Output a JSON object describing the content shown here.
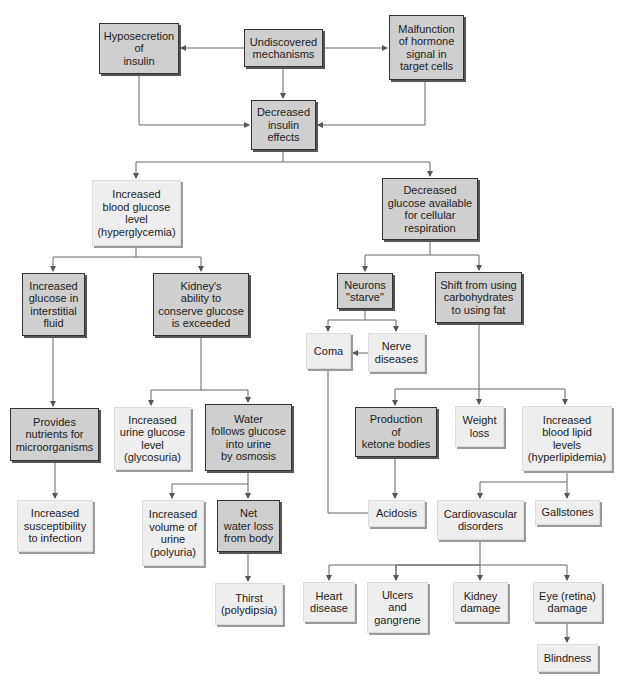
{
  "caption": "Diabetes mellitus: pathophysiology of insulin deficiency (flow diagram)",
  "colors": {
    "dark_box": "#cfcfcf",
    "light_box": "#eeeeee",
    "line": "#555555"
  },
  "nodes": {
    "hyposecretion": "Hyposecretion\nof\ninsulin",
    "undiscovered": "Undiscovered\nmechanisms",
    "malfunction": "Malfunction\nof hormone\nsignal in\ntarget cells",
    "decreased_insulin": "Decreased\ninsulin\neffects",
    "hyperglycemia": "Increased\nblood glucose\nlevel\n(hyperglycemia)",
    "decreased_glucose": "Decreased\nglucose available\nfor cellular\nrespiration",
    "interstitial": "Increased\nglucose in\ninterstitial\nfluid",
    "kidney_exceeded": "Kidney's\nability to\nconserve glucose\nis exceeded",
    "neurons": "Neurons\n\"starve\"",
    "shift": "Shift from using\ncarbohydrates\nto using fat",
    "coma": "Coma",
    "nerve": "Nerve\ndiseases",
    "nutrients": "Provides\nnutrients for\nmicroorganisms",
    "glycosuria": "Increased\nurine glucose\nlevel\n(glycosuria)",
    "water_follows": "Water\nfollows glucose\ninto urine\nby osmosis",
    "ketone": "Production\nof\nketone bodies",
    "weight_loss": "Weight\nloss",
    "hyperlipidemia": "Increased\nblood lipid\nlevels\n(hyperlipidemia)",
    "infection": "Increased\nsusceptibility\nto infection",
    "polyuria": "Increased\nvolume of\nurine\n(polyuria)",
    "net_water": "Net\nwater loss\nfrom body",
    "acidosis": "Acidosis",
    "cardiovascular": "Cardiovascular\ndisorders",
    "gallstones": "Gallstones",
    "thirst": "Thirst\n(polydipsia)",
    "heart": "Heart\ndisease",
    "ulcers": "Ulcers\nand\ngangrene",
    "kidney_damage": "Kidney\ndamage",
    "eye": "Eye (retina)\ndamage",
    "blindness": "Blindness"
  }
}
